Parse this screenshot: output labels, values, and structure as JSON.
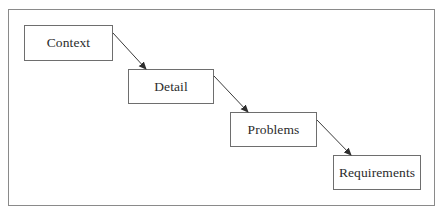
{
  "diagram": {
    "type": "waterfall-flow",
    "nodes": [
      {
        "id": "context",
        "label": "Context",
        "x": 24,
        "y": 25,
        "w": 89,
        "h": 36
      },
      {
        "id": "detail",
        "label": "Detail",
        "x": 128,
        "y": 69,
        "w": 86,
        "h": 35
      },
      {
        "id": "problems",
        "label": "Problems",
        "x": 230,
        "y": 112,
        "w": 87,
        "h": 35
      },
      {
        "id": "requirements",
        "label": "Requirements",
        "x": 333,
        "y": 155,
        "w": 88,
        "h": 35
      }
    ],
    "edges": [
      {
        "from": "context",
        "to": "detail"
      },
      {
        "from": "detail",
        "to": "problems"
      },
      {
        "from": "problems",
        "to": "requirements"
      }
    ],
    "colors": {
      "frame_border": "#8a8a8a",
      "node_border": "#6e6e6e",
      "text": "#2b2b2b",
      "arrow": "#3a3a3a"
    }
  }
}
